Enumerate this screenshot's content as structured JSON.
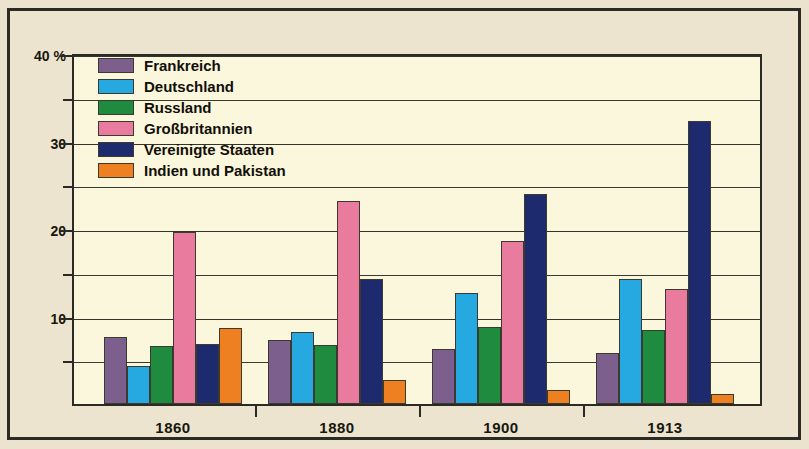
{
  "chart_data": {
    "type": "bar",
    "title": "",
    "subtitle": "",
    "xlabel": "",
    "ylabel": "",
    "ylim": [
      0,
      40
    ],
    "y_unit": "%",
    "grid": true,
    "legend_position": "top-left-inside",
    "categories": [
      "1860",
      "1880",
      "1900",
      "1913"
    ],
    "y_ticks_major": [
      {
        "value": 40,
        "label": "40 %"
      },
      {
        "value": 30,
        "label": "30"
      },
      {
        "value": 20,
        "label": "20"
      },
      {
        "value": 10,
        "label": "10"
      }
    ],
    "y_ticks_minor": [
      35,
      25,
      15,
      5
    ],
    "series": [
      {
        "name": "Frankreich",
        "color": "#7d5f8e",
        "values": [
          7.7,
          7.3,
          6.3,
          5.8
        ]
      },
      {
        "name": "Deutschland",
        "color": "#26a9e0",
        "values": [
          4.3,
          8.2,
          12.7,
          14.3
        ]
      },
      {
        "name": "Russland",
        "color": "#1f8b3e",
        "values": [
          6.6,
          6.8,
          8.8,
          8.5
        ]
      },
      {
        "name": "Großbritannien",
        "color": "#e87b9e",
        "values": [
          19.7,
          23.2,
          18.6,
          13.1
        ]
      },
      {
        "name": "Vereinigte Staaten",
        "color": "#1e2a6e",
        "values": [
          6.9,
          14.3,
          24.0,
          32.3
        ]
      },
      {
        "name": "Indien und Pakistan",
        "color": "#ef8022",
        "values": [
          8.7,
          2.8,
          1.6,
          1.1
        ]
      }
    ]
  },
  "legend": {
    "items": [
      {
        "label": "Frankreich",
        "color": "#7d5f8e"
      },
      {
        "label": "Deutschland",
        "color": "#26a9e0"
      },
      {
        "label": "Russland",
        "color": "#1f8b3e"
      },
      {
        "label": "Großbritannien",
        "color": "#e87b9e"
      },
      {
        "label": "Vereinigte Staaten",
        "color": "#1e2a6e"
      },
      {
        "label": "Indien und Pakistan",
        "color": "#ef8022"
      }
    ]
  },
  "colors": {
    "page_background": "#ebe3cd",
    "plot_background": "#fbf7dc",
    "frame": "#2c2a24",
    "gridline": "#34342a",
    "text": "#17170f"
  }
}
